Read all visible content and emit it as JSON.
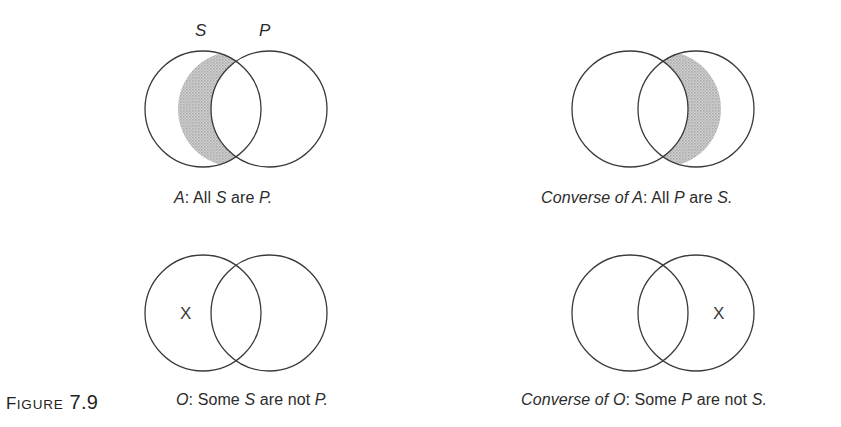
{
  "figure": {
    "label_prefix": "F",
    "label_word": "IGURE",
    "number": "7.9"
  },
  "colors": {
    "stroke": "#3a3a3a",
    "shade": "#c3c3c3",
    "background": "#ffffff",
    "text": "#2b2b2b"
  },
  "diagrams": [
    {
      "id": "all-s-are-p",
      "shaded_region": "left-only",
      "x_mark": null,
      "top_labels": [
        {
          "text": "S",
          "name": "label-s"
        },
        {
          "text": "P",
          "name": "label-p"
        }
      ],
      "caption_parts": [
        {
          "text": "A",
          "style": "italic"
        },
        {
          "text": ": All ",
          "style": "roman"
        },
        {
          "text": "S",
          "style": "italic"
        },
        {
          "text": " are ",
          "style": "roman"
        },
        {
          "text": "P.",
          "style": "italic"
        }
      ],
      "caption_plain": "A: All S are P."
    },
    {
      "id": "converse-of-a",
      "shaded_region": "right-only",
      "x_mark": null,
      "top_labels": [],
      "caption_parts": [
        {
          "text": "Converse of A",
          "style": "italic"
        },
        {
          "text": ": All ",
          "style": "roman"
        },
        {
          "text": "P",
          "style": "italic"
        },
        {
          "text": " are ",
          "style": "roman"
        },
        {
          "text": "S.",
          "style": "italic"
        }
      ],
      "caption_plain": "Converse of A: All P are S."
    },
    {
      "id": "some-s-are-not-p",
      "shaded_region": "none",
      "x_mark": {
        "text": "X",
        "region": "left-only"
      },
      "top_labels": [],
      "caption_parts": [
        {
          "text": "O",
          "style": "italic"
        },
        {
          "text": ": Some ",
          "style": "roman"
        },
        {
          "text": "S",
          "style": "italic"
        },
        {
          "text": " are not ",
          "style": "roman"
        },
        {
          "text": "P.",
          "style": "italic"
        }
      ],
      "caption_plain": "O: Some S are not P."
    },
    {
      "id": "converse-of-o",
      "shaded_region": "none",
      "x_mark": {
        "text": "X",
        "region": "right-only"
      },
      "top_labels": [],
      "caption_parts": [
        {
          "text": "Converse of O",
          "style": "italic"
        },
        {
          "text": ": Some ",
          "style": "roman"
        },
        {
          "text": "P",
          "style": "italic"
        },
        {
          "text": " are not ",
          "style": "roman"
        },
        {
          "text": "S.",
          "style": "italic"
        }
      ],
      "caption_plain": "Converse of O: Some P are not S."
    }
  ]
}
